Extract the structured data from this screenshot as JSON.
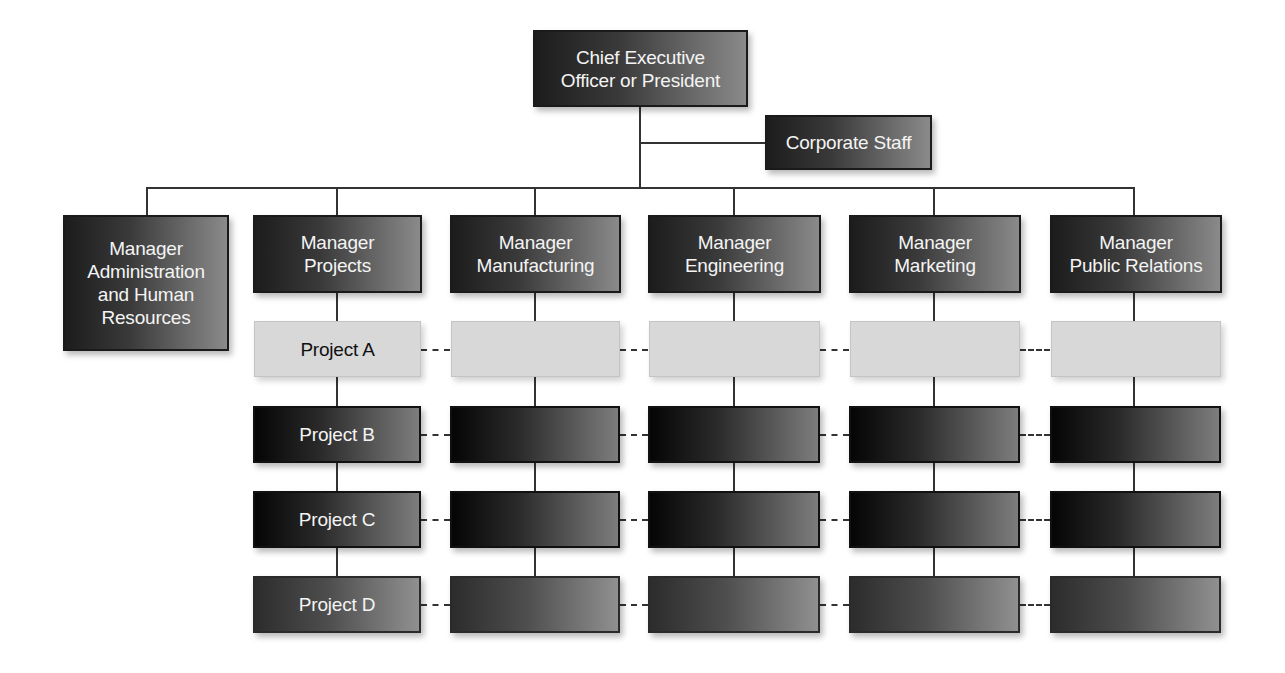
{
  "diagram": {
    "type": "organization-chart",
    "ceo": {
      "label": "Chief Executive\nOfficer or President"
    },
    "corporate_staff": {
      "label": "Corporate Staff"
    },
    "administration": {
      "label": "Manager\nAdministration\nand Human\nResources"
    },
    "managers": [
      {
        "label": "Manager\nProjects"
      },
      {
        "label": "Manager\nManufacturing"
      },
      {
        "label": "Manager\nEngineering"
      },
      {
        "label": "Manager\nMarketing"
      },
      {
        "label": "Manager\nPublic Relations"
      }
    ],
    "projects": [
      {
        "label": "Project A",
        "style": "light"
      },
      {
        "label": "Project B",
        "style": "dark"
      },
      {
        "label": "Project C",
        "style": "dark"
      },
      {
        "label": "Project D",
        "style": "mid"
      }
    ],
    "colors": {
      "dark_box_start": "#050505",
      "dark_box_end": "#8a8a8a",
      "light_box": "#d8d8d8",
      "connector": "#333333",
      "text_on_dark": "#f4f4f4",
      "text_on_light": "#111111"
    }
  }
}
